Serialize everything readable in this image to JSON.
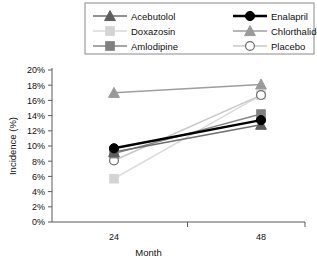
{
  "chart_data": {
    "type": "line",
    "title": "",
    "xlabel": "Month",
    "ylabel": "Incidence (%)",
    "x": [
      24,
      48
    ],
    "categories": [
      "24",
      "48"
    ],
    "xtick_labels": [
      "24",
      "48"
    ],
    "ytick_labels": [
      "0%",
      "2%",
      "4%",
      "6%",
      "8%",
      "10%",
      "12%",
      "14%",
      "16%",
      "18%",
      "20%"
    ],
    "ytick_values": [
      0,
      2,
      4,
      6,
      8,
      10,
      12,
      14,
      16,
      18,
      20
    ],
    "ylim": [
      0,
      20
    ],
    "xlim": [
      0,
      72
    ],
    "grid": false,
    "legend_position": "top",
    "series": [
      {
        "name": "Acebutolol",
        "marker": "triangle",
        "color": "#5e5e5e",
        "line_color": "#6e6e6e",
        "values": [
          9.2,
          12.8
        ]
      },
      {
        "name": "Enalapril",
        "marker": "circle",
        "color": "#000000",
        "line_color": "#000000",
        "values": [
          9.7,
          13.4
        ]
      },
      {
        "name": "Doxazosin",
        "marker": "square",
        "color": "#d4d4d4",
        "line_color": "#d9d9d9",
        "values": [
          5.7,
          16.7
        ]
      },
      {
        "name": "Chlorthalidone",
        "marker": "triangle",
        "color": "#9a9a9a",
        "line_color": "#9e9e9e",
        "values": [
          17.0,
          18.1
        ]
      },
      {
        "name": "Amlodipine",
        "marker": "square",
        "color": "#808080",
        "line_color": "#888888",
        "values": [
          9.0,
          14.2
        ]
      },
      {
        "name": "Placebo",
        "marker": "open-circle",
        "color": "#ffffff",
        "line_color": "#c8c8c8",
        "values": [
          8.1,
          16.7
        ]
      }
    ],
    "legend_entries": [
      {
        "label": "Acebutolol",
        "marker": "triangle",
        "color": "#5e5e5e",
        "line_color": "#6e6e6e"
      },
      {
        "label": "Enalapril",
        "marker": "circle",
        "color": "#000000",
        "line_color": "#000000"
      },
      {
        "label": "Doxazosin",
        "marker": "square",
        "color": "#d4d4d4",
        "line_color": "#d9d9d9"
      },
      {
        "label": "Chlorthalidone",
        "marker": "triangle",
        "color": "#9a9a9a",
        "line_color": "#9e9e9e"
      },
      {
        "label": "Amlodipine",
        "marker": "square",
        "color": "#808080",
        "line_color": "#888888"
      },
      {
        "label": "Placebo",
        "marker": "open-circle",
        "color": "#ffffff",
        "line_color": "#c8c8c8"
      }
    ]
  }
}
